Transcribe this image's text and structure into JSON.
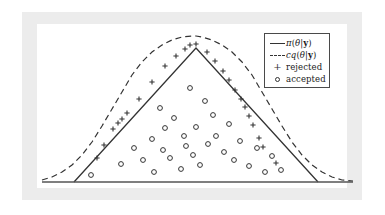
{
  "figure": {
    "title": "",
    "background_color": "#ffffff",
    "frame_color": "#ececec",
    "plate_color": "#ffffff",
    "line_color": "#333333",
    "axis_color": "#555555"
  },
  "legend": {
    "position": "top-right",
    "border_color": "#4a4a4a",
    "entries": [
      {
        "key": "solid-line",
        "label_html": "π(θ|y)",
        "label_plain": "π(θ|y)",
        "name": "target-density"
      },
      {
        "key": "dashed-line",
        "label_html": "cq(θ|y)",
        "label_plain": "cq(θ|y)",
        "name": "proposal-density"
      },
      {
        "key": "plus-marker",
        "label_html": "rejected",
        "label_plain": "rejected",
        "name": "rejected-samples"
      },
      {
        "key": "circle-marker",
        "label_html": "accepted",
        "label_plain": "accepted",
        "name": "accepted-samples"
      }
    ]
  },
  "chart_data": {
    "type": "scatter",
    "title": "",
    "xlabel": "",
    "ylabel": "",
    "grid": false,
    "legend_position": "top-right",
    "axis": {
      "baseline_y": 182,
      "x_start": 42,
      "x_end": 353,
      "show_ticks": false,
      "show_labels": false
    },
    "series": [
      {
        "name": "π(θ|y)",
        "type": "line",
        "style": "solid",
        "color": "#333333",
        "description": "triangular target density",
        "points": [
          [
            74,
            182
          ],
          [
            196,
            48
          ],
          [
            318,
            182
          ]
        ]
      },
      {
        "name": "cq(θ|y)",
        "type": "line",
        "style": "dashed",
        "color": "#333333",
        "description": "scaled gaussian proposal envelope",
        "points": [
          [
            42,
            180
          ],
          [
            52,
            177
          ],
          [
            62,
            172
          ],
          [
            72,
            165
          ],
          [
            82,
            155
          ],
          [
            92,
            142
          ],
          [
            102,
            126
          ],
          [
            112,
            109
          ],
          [
            122,
            92
          ],
          [
            132,
            75
          ],
          [
            142,
            62
          ],
          [
            152,
            52
          ],
          [
            162,
            45
          ],
          [
            172,
            40
          ],
          [
            182,
            37
          ],
          [
            192,
            36
          ],
          [
            196,
            36
          ],
          [
            202,
            37
          ],
          [
            212,
            40
          ],
          [
            222,
            45
          ],
          [
            232,
            52
          ],
          [
            242,
            62
          ],
          [
            252,
            75
          ],
          [
            262,
            92
          ],
          [
            272,
            109
          ],
          [
            282,
            126
          ],
          [
            292,
            142
          ],
          [
            302,
            155
          ],
          [
            312,
            165
          ],
          [
            322,
            172
          ],
          [
            332,
            177
          ],
          [
            342,
            180
          ],
          [
            353,
            181
          ]
        ]
      },
      {
        "name": "rejected",
        "type": "scatter",
        "marker": "+",
        "color": "#333333",
        "points": [
          [
            97,
            158
          ],
          [
            104,
            145
          ],
          [
            113,
            129
          ],
          [
            118,
            123
          ],
          [
            122,
            119
          ],
          [
            127,
            113
          ],
          [
            139,
            99
          ],
          [
            152,
            82
          ],
          [
            165,
            66
          ],
          [
            176,
            56
          ],
          [
            185,
            49
          ],
          [
            190,
            45
          ],
          [
            196,
            44
          ],
          [
            207,
            52
          ],
          [
            215,
            61
          ],
          [
            223,
            71
          ],
          [
            229,
            80
          ],
          [
            235,
            90
          ],
          [
            241,
            99
          ],
          [
            245,
            107
          ],
          [
            249,
            116
          ],
          [
            253,
            125
          ],
          [
            259,
            138
          ],
          [
            263,
            147
          ],
          [
            276,
            163
          ]
        ]
      },
      {
        "name": "accepted",
        "type": "scatter",
        "marker": "o",
        "color": "#333333",
        "points": [
          [
            91,
            175
          ],
          [
            121,
            164
          ],
          [
            134,
            148
          ],
          [
            143,
            160
          ],
          [
            152,
            139
          ],
          [
            154,
            172
          ],
          [
            160,
            108
          ],
          [
            163,
            150
          ],
          [
            165,
            128
          ],
          [
            170,
            158
          ],
          [
            174,
            118
          ],
          [
            181,
            169
          ],
          [
            184,
            136
          ],
          [
            186,
            146
          ],
          [
            190,
            88
          ],
          [
            193,
            155
          ],
          [
            196,
            127
          ],
          [
            200,
            165
          ],
          [
            205,
            101
          ],
          [
            208,
            144
          ],
          [
            213,
            115
          ],
          [
            216,
            136
          ],
          [
            224,
            152
          ],
          [
            229,
            124
          ],
          [
            234,
            160
          ],
          [
            240,
            141
          ],
          [
            249,
            166
          ],
          [
            257,
            148
          ],
          [
            265,
            172
          ],
          [
            272,
            156
          ],
          [
            281,
            170
          ]
        ]
      }
    ]
  }
}
